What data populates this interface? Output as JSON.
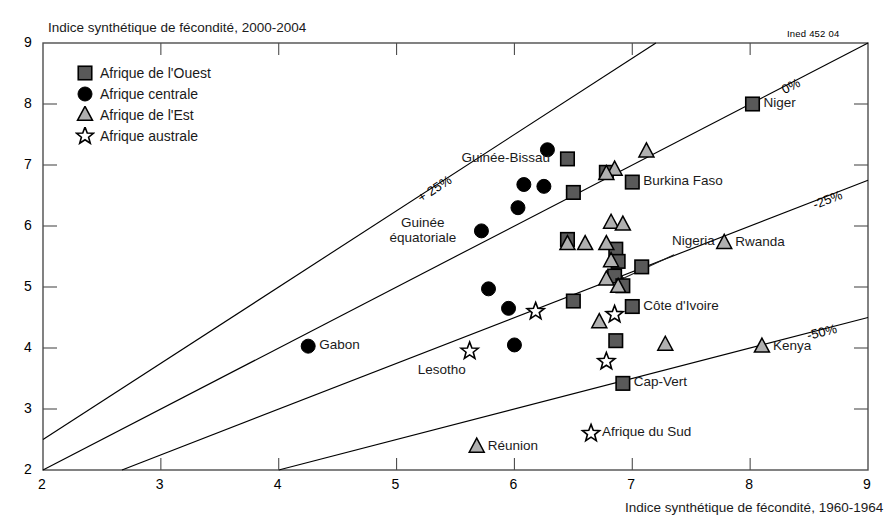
{
  "meta": {
    "source_code": "Ined 452 04",
    "ylabel": "Indice synthétique de fécondité, 2000-2004",
    "xlabel": "Indice synthétique de fécondité, 1960-1964"
  },
  "legend": {
    "items": [
      {
        "label": "Afrique de l'Ouest",
        "marker": "square",
        "icon": "square-marker-icon"
      },
      {
        "label": "Afrique centrale",
        "marker": "circle",
        "icon": "circle-marker-icon"
      },
      {
        "label": "Afrique de l'Est",
        "marker": "triangle",
        "icon": "triangle-marker-icon"
      },
      {
        "label": "Afrique austral",
        "marker": "star",
        "icon": "star-marker-icon"
      }
    ],
    "item_labels": [
      "Afrique de l'Ouest",
      "Afrique centrale",
      "Afrique de l'Est",
      "Afrique australe"
    ]
  },
  "colors": {
    "square_fill": "#595959",
    "circle_fill": "#000000",
    "triangle_fill": "#b0b0b0",
    "star_fill": "#ffffff",
    "stroke": "#000000",
    "axis": "#4d4d4d",
    "background": "#ffffff"
  },
  "chart_data": {
    "type": "scatter",
    "title": "",
    "xlabel": "Indice synthétique de fécondité, 1960-1964",
    "ylabel": "Indice synthétique de fécondité, 2000-2004",
    "xlim": [
      2,
      9
    ],
    "ylim": [
      2,
      9
    ],
    "xticks": [
      2,
      3,
      4,
      5,
      6,
      7,
      8,
      9
    ],
    "yticks": [
      2,
      3,
      4,
      5,
      6,
      7,
      8,
      9
    ],
    "xtick_labels": [
      "2",
      "3",
      "4",
      "5",
      "6",
      "7",
      "8",
      "9"
    ],
    "ytick_labels": [
      "2",
      "3",
      "4",
      "5",
      "6",
      "7",
      "8",
      "9"
    ],
    "grid": false,
    "legend_position": "top-left",
    "reference_lines": [
      {
        "label": "+ 25%",
        "ratio": 1.25,
        "x0": 2.0,
        "y0": 2.5,
        "x1": 7.2,
        "y1": 9.0
      },
      {
        "label": "0%",
        "ratio": 1.0,
        "x0": 2.0,
        "y0": 2.0,
        "x1": 9.0,
        "y1": 9.0
      },
      {
        "label": "-25%",
        "ratio": 0.75,
        "x0": 2.67,
        "y0": 2.0,
        "x1": 9.0,
        "y1": 6.75
      },
      {
        "label": "-50%",
        "ratio": 0.5,
        "x0": 4.0,
        "y0": 2.0,
        "x1": 9.0,
        "y1": 4.5
      }
    ],
    "annotations": [
      {
        "text": "Nigeria",
        "kind": "arrow-callout",
        "target_x": 6.82,
        "target_y": 5.2
      }
    ],
    "series": [
      {
        "name": "Afrique de l'Ouest",
        "marker": "square",
        "points": [
          {
            "label": "Guinée-Bissau",
            "x": 6.45,
            "y": 7.1,
            "label_side": "left"
          },
          {
            "label": "",
            "x": 6.5,
            "y": 6.55,
            "label_side": ""
          },
          {
            "label": "",
            "x": 6.78,
            "y": 6.88,
            "label_side": ""
          },
          {
            "label": "Burkina Faso",
            "x": 7.0,
            "y": 6.72,
            "label_side": "right"
          },
          {
            "label": "Niger",
            "x": 8.02,
            "y": 8.0,
            "label_side": "right"
          },
          {
            "label": "",
            "x": 6.45,
            "y": 5.78,
            "label_side": ""
          },
          {
            "label": "Nigeria",
            "x": 6.86,
            "y": 5.62,
            "label_side": "arrow"
          },
          {
            "label": "",
            "x": 6.88,
            "y": 5.42,
            "label_side": ""
          },
          {
            "label": "",
            "x": 6.85,
            "y": 5.18,
            "label_side": ""
          },
          {
            "label": "",
            "x": 7.08,
            "y": 5.33,
            "label_side": ""
          },
          {
            "label": "",
            "x": 6.92,
            "y": 5.02,
            "label_side": ""
          },
          {
            "label": "",
            "x": 6.5,
            "y": 4.77,
            "label_side": ""
          },
          {
            "label": "Côte d'Ivoire",
            "x": 7.0,
            "y": 4.68,
            "label_side": "right"
          },
          {
            "label": "",
            "x": 6.86,
            "y": 4.12,
            "label_side": ""
          },
          {
            "label": "Cap-Vert",
            "x": 6.92,
            "y": 3.42,
            "label_side": "right"
          }
        ]
      },
      {
        "name": "Afrique centrale",
        "marker": "circle",
        "points": [
          {
            "label": "",
            "x": 6.28,
            "y": 7.25,
            "label_side": ""
          },
          {
            "label": "",
            "x": 6.08,
            "y": 6.68,
            "label_side": ""
          },
          {
            "label": "",
            "x": 6.25,
            "y": 6.65,
            "label_side": ""
          },
          {
            "label": "",
            "x": 6.03,
            "y": 6.3,
            "label_side": ""
          },
          {
            "label": "Guinée équatoriale",
            "x": 5.72,
            "y": 5.92,
            "label_side": "left"
          },
          {
            "label": "",
            "x": 5.78,
            "y": 4.97,
            "label_side": ""
          },
          {
            "label": "",
            "x": 5.95,
            "y": 4.65,
            "label_side": ""
          },
          {
            "label": "Gabon",
            "x": 4.25,
            "y": 4.03,
            "label_side": "right"
          },
          {
            "label": "",
            "x": 6.0,
            "y": 4.05,
            "label_side": ""
          }
        ]
      },
      {
        "name": "Afrique de l'Est",
        "marker": "triangle",
        "points": [
          {
            "label": "",
            "x": 7.12,
            "y": 7.22,
            "label_side": ""
          },
          {
            "label": "",
            "x": 6.85,
            "y": 6.92,
            "label_side": ""
          },
          {
            "label": "",
            "x": 6.78,
            "y": 6.85,
            "label_side": ""
          },
          {
            "label": "",
            "x": 6.82,
            "y": 6.05,
            "label_side": ""
          },
          {
            "label": "",
            "x": 6.92,
            "y": 6.02,
            "label_side": ""
          },
          {
            "label": "",
            "x": 6.45,
            "y": 5.7,
            "label_side": ""
          },
          {
            "label": "",
            "x": 6.6,
            "y": 5.7,
            "label_side": ""
          },
          {
            "label": "",
            "x": 6.78,
            "y": 5.7,
            "label_side": ""
          },
          {
            "label": "",
            "x": 6.82,
            "y": 5.42,
            "label_side": ""
          },
          {
            "label": "Rwanda",
            "x": 7.78,
            "y": 5.72,
            "label_side": "right"
          },
          {
            "label": "",
            "x": 6.78,
            "y": 5.12,
            "label_side": ""
          },
          {
            "label": "",
            "x": 6.88,
            "y": 5.0,
            "label_side": ""
          },
          {
            "label": "",
            "x": 6.72,
            "y": 4.42,
            "label_side": ""
          },
          {
            "label": "Kenya",
            "x": 8.1,
            "y": 4.02,
            "label_side": "right"
          },
          {
            "label": "",
            "x": 7.28,
            "y": 4.05,
            "label_side": ""
          },
          {
            "label": "Réunion",
            "x": 5.68,
            "y": 2.38,
            "label_side": "right"
          }
        ]
      },
      {
        "name": "Afrique australe",
        "marker": "star",
        "points": [
          {
            "label": "",
            "x": 6.18,
            "y": 4.6,
            "label_side": ""
          },
          {
            "label": "",
            "x": 6.85,
            "y": 4.55,
            "label_side": ""
          },
          {
            "label": "Lesotho",
            "x": 5.62,
            "y": 3.95,
            "label_side": "below"
          },
          {
            "label": "",
            "x": 6.78,
            "y": 3.78,
            "label_side": ""
          },
          {
            "label": "Afrique du Sud",
            "x": 6.65,
            "y": 2.6,
            "label_side": "right"
          }
        ]
      }
    ]
  }
}
